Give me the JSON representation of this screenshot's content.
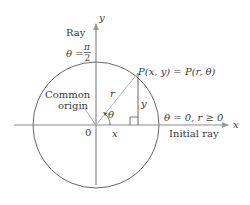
{
  "diagram": {
    "axes": {
      "x_label": "x",
      "y_label": "y",
      "origin_label": "0"
    },
    "labels": {
      "ray_top": "Ray",
      "theta_pi_over_2_prefix": "θ =",
      "pi": "π",
      "two": "2",
      "common": "Common",
      "origin": "origin",
      "point": "P(x, y) = P(r, θ)",
      "theta0": "θ = 0, r ≥ 0",
      "initial_ray": "Initial ray",
      "r": "r",
      "y_seg": "y",
      "x_seg": "x",
      "theta_angle": "θ"
    },
    "colors": {
      "axis": "#8a8a8a",
      "circle": "#555555",
      "radius": "#b0b0b0",
      "text": "#3a3a3a"
    }
  }
}
